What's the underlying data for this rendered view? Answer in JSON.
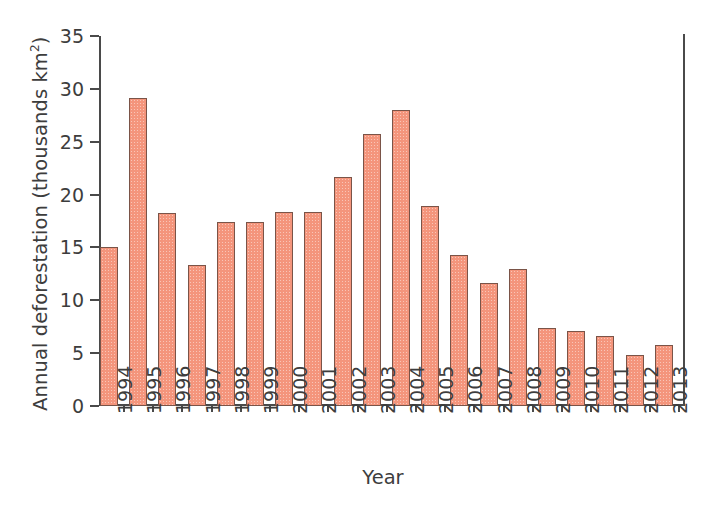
{
  "chart_data": {
    "type": "bar",
    "title": "",
    "xlabel": "Year",
    "ylabel": "Annual deforestation (thousands km²)",
    "ylabel_main": "Annual deforestation (thousands km",
    "ylabel_sup": "2",
    "ylabel_close": ")",
    "categories": [
      "1994",
      "1995",
      "1996",
      "1997",
      "1998",
      "1999",
      "2000",
      "2001",
      "2002",
      "2003",
      "2004",
      "2005",
      "2006",
      "2007",
      "2008",
      "2009",
      "2010",
      "2011",
      "2012",
      "2013"
    ],
    "values": [
      15.0,
      29.1,
      18.3,
      13.3,
      17.4,
      17.4,
      18.4,
      18.4,
      21.7,
      25.7,
      28.0,
      18.9,
      14.3,
      11.6,
      13.0,
      7.4,
      7.1,
      6.6,
      4.8,
      5.8
    ],
    "ylim": [
      0,
      35
    ],
    "ytick_values": [
      0,
      5,
      10,
      15,
      20,
      25,
      30,
      35
    ],
    "ytick_labels": [
      "0",
      "5",
      "10",
      "15",
      "20",
      "25",
      "30",
      "35"
    ],
    "grid": false,
    "legend": false,
    "bar_color": "#f4957c",
    "bar_edge_color": "#7a5448",
    "axis_color": "#4a4a4a",
    "text_color": "#3d3d3d"
  }
}
